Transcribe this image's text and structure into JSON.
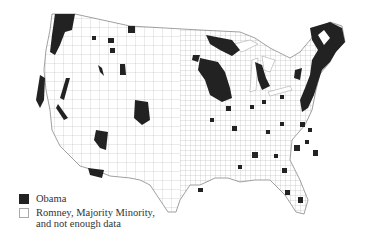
{
  "map": {
    "subject": "US counties, 2012 presidential election",
    "colors": {
      "obama": "#222222",
      "other": "#ffffff",
      "borders": "#9a9a9a"
    }
  },
  "legend": {
    "items": [
      {
        "label": "Obama",
        "swatch": "black"
      },
      {
        "label_line1": "Romney, Majority Minority,",
        "label_line2": "and not enough data",
        "swatch": "white"
      }
    ]
  }
}
